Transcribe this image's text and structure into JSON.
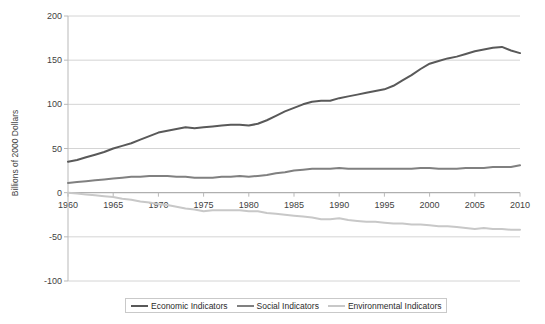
{
  "chart_data": {
    "type": "line",
    "title": "",
    "xlabel": "",
    "ylabel": "Billions of 2000 Dollars",
    "xlim": [
      1960,
      2010
    ],
    "ylim": [
      -100,
      200
    ],
    "yticks": [
      200,
      150,
      100,
      50,
      0,
      -50,
      -100
    ],
    "xticks": [
      1960,
      1965,
      1970,
      1975,
      1980,
      1985,
      1990,
      1995,
      2000,
      2005,
      2010
    ],
    "grid": "horizontal",
    "legend_position": "bottom",
    "x": [
      1960,
      1961,
      1962,
      1963,
      1964,
      1965,
      1966,
      1967,
      1968,
      1969,
      1970,
      1971,
      1972,
      1973,
      1974,
      1975,
      1976,
      1977,
      1978,
      1979,
      1980,
      1981,
      1982,
      1983,
      1984,
      1985,
      1986,
      1987,
      1988,
      1989,
      1990,
      1991,
      1992,
      1993,
      1994,
      1995,
      1996,
      1997,
      1998,
      1999,
      2000,
      2001,
      2002,
      2003,
      2004,
      2005,
      2006,
      2007,
      2008,
      2009,
      2010
    ],
    "series": [
      {
        "name": "Economic Indicators",
        "color": "#595959",
        "values": [
          35,
          37,
          40,
          43,
          46,
          50,
          53,
          56,
          60,
          64,
          68,
          70,
          72,
          74,
          73,
          74,
          75,
          76,
          77,
          77,
          76,
          78,
          82,
          87,
          92,
          96,
          100,
          103,
          104,
          104,
          107,
          109,
          111,
          113,
          115,
          117,
          121,
          127,
          133,
          140,
          146,
          149,
          152,
          154,
          157,
          160,
          162,
          164,
          165,
          161,
          158
        ]
      },
      {
        "name": "Social Indicators",
        "color": "#808080",
        "values": [
          11,
          12,
          13,
          14,
          15,
          16,
          17,
          18,
          18,
          19,
          19,
          19,
          18,
          18,
          17,
          17,
          17,
          18,
          18,
          19,
          18,
          19,
          20,
          22,
          23,
          25,
          26,
          27,
          27,
          27,
          28,
          27,
          27,
          27,
          27,
          27,
          27,
          27,
          27,
          28,
          28,
          27,
          27,
          27,
          28,
          28,
          28,
          29,
          29,
          29,
          31
        ]
      },
      {
        "name": "Environmental Indicators",
        "color": "#c8c8c8",
        "values": [
          0,
          -1,
          -2,
          -3,
          -4,
          -5,
          -7,
          -8,
          -10,
          -11,
          -13,
          -14,
          -16,
          -18,
          -19,
          -21,
          -20,
          -20,
          -20,
          -20,
          -21,
          -21,
          -23,
          -24,
          -25,
          -26,
          -27,
          -28,
          -30,
          -30,
          -29,
          -31,
          -32,
          -33,
          -33,
          -34,
          -35,
          -35,
          -36,
          -36,
          -37,
          -38,
          -38,
          -39,
          -40,
          -41,
          -40,
          -41,
          -41,
          -42,
          -42
        ]
      }
    ]
  },
  "legend": {
    "items": [
      {
        "label": "Economic Indicators",
        "color": "#595959"
      },
      {
        "label": "Social Indicators",
        "color": "#808080"
      },
      {
        "label": "Environmental Indicators",
        "color": "#c8c8c8"
      }
    ]
  }
}
